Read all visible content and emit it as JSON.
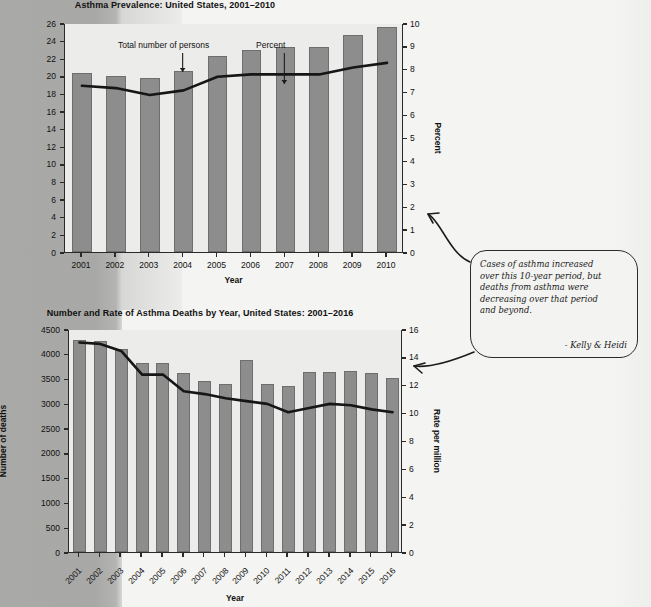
{
  "chart_data": [
    {
      "type": "bar",
      "id": "asthma-prevalence",
      "title": "Asthma Prevalence: United States, 2001–2010",
      "xlabel": "Year",
      "ylabel": "Total number of persons in millions",
      "y2label": "Percent",
      "categories": [
        "2001",
        "2002",
        "2003",
        "2004",
        "2005",
        "2006",
        "2007",
        "2008",
        "2009",
        "2010"
      ],
      "ylim": [
        0,
        26
      ],
      "yticks": [
        0,
        2,
        4,
        6,
        8,
        10,
        12,
        14,
        16,
        18,
        20,
        22,
        24,
        26
      ],
      "y2lim": [
        0,
        10
      ],
      "y2ticks": [
        0,
        1,
        2,
        3,
        4,
        5,
        6,
        7,
        8,
        9,
        10
      ],
      "grid": false,
      "legend": "none",
      "series": [
        {
          "name": "Total number of persons",
          "kind": "bar",
          "axis": "left",
          "values": [
            20.3,
            20.0,
            19.8,
            20.5,
            22.2,
            22.9,
            23.3,
            23.3,
            24.6,
            25.5
          ]
        },
        {
          "name": "Percent",
          "kind": "line",
          "axis": "right",
          "values": [
            7.3,
            7.2,
            6.9,
            7.1,
            7.7,
            7.8,
            7.8,
            7.8,
            8.1,
            8.3
          ]
        }
      ],
      "annotations": [
        {
          "text": "Total number of persons",
          "points_to": "2004"
        },
        {
          "text": "Percent",
          "points_to": "2007"
        }
      ]
    },
    {
      "type": "bar",
      "id": "asthma-deaths",
      "title": "Number and Rate of Asthma Deaths by Year, United States: 2001–2016",
      "xlabel": "Year",
      "ylabel": "Number of deaths",
      "y2label": "Rate per million",
      "categories": [
        "2001",
        "2002",
        "2003",
        "2004",
        "2005",
        "2006",
        "2007",
        "2008",
        "2009",
        "2010",
        "2011",
        "2012",
        "2013",
        "2014",
        "2015",
        "2016"
      ],
      "ylim": [
        0,
        4500
      ],
      "yticks": [
        0,
        500,
        1000,
        1500,
        2000,
        2500,
        3000,
        3500,
        4000,
        4500
      ],
      "y2lim": [
        0,
        16
      ],
      "y2ticks": [
        0,
        2,
        4,
        6,
        8,
        10,
        12,
        14,
        16
      ],
      "grid": false,
      "legend": "none",
      "series": [
        {
          "name": "Number of deaths",
          "kind": "bar",
          "axis": "left",
          "values": [
            4269,
            4261,
            4099,
            3816,
            3816,
            3613,
            3447,
            3388,
            3874,
            3388,
            3345,
            3630,
            3630,
            3651,
            3615,
            3518
          ]
        },
        {
          "name": "Rate per million",
          "kind": "line",
          "axis": "right",
          "values": [
            15.1,
            15.0,
            14.5,
            12.8,
            12.8,
            11.6,
            11.4,
            11.1,
            10.9,
            10.7,
            10.1,
            10.4,
            10.7,
            10.6,
            10.3,
            10.1
          ]
        }
      ]
    }
  ],
  "note": {
    "line1": "Cases of asthma increased",
    "line2": "over this 10-year period, but",
    "line3": "deaths from asthma were",
    "line4": "decreasing over that period",
    "line5": "and beyond.",
    "signature": "- Kelly & Heidi"
  },
  "colors": {
    "bar": "#8d8d8d",
    "bar_border": "#6e6e6e",
    "line": "#161616",
    "axis": "#2a2a2a",
    "plot_bg": "#ececea",
    "paper": "#f4f4f2",
    "scan_shadow": "#a9a9a7"
  }
}
